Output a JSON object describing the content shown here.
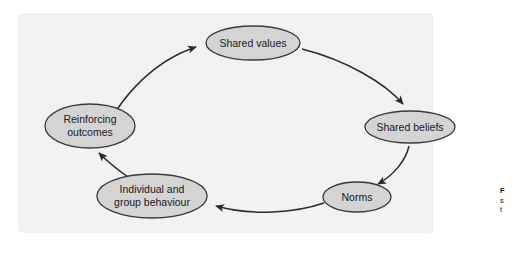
{
  "figure": {
    "background_color": "#f2f2f2",
    "page_background_color": "#ffffff",
    "node_fill_color": "#d4d4d4",
    "node_stroke_color": "#3a3a3a",
    "arrow_color": "#2b2b2b",
    "label_color": "#1a1a1a"
  },
  "diagram": {
    "type": "cycle",
    "direction": "clockwise",
    "nodes": [
      {
        "id": "shared-values",
        "label": "Shared values",
        "lines": [
          "Shared values"
        ],
        "cx": 253,
        "cy": 43,
        "rx": 47,
        "ry": 17
      },
      {
        "id": "shared-beliefs",
        "label": "Shared beliefs",
        "lines": [
          "Shared beliefs"
        ],
        "cx": 410,
        "cy": 127,
        "rx": 45,
        "ry": 16
      },
      {
        "id": "norms",
        "label": "Norms",
        "lines": [
          "Norms"
        ],
        "cx": 357,
        "cy": 197,
        "rx": 34,
        "ry": 15
      },
      {
        "id": "individual-and-group-behaviour",
        "label": "Individual and group behaviour",
        "lines": [
          "Individual and",
          "group behaviour"
        ],
        "cx": 152,
        "cy": 196,
        "rx": 55,
        "ry": 22
      },
      {
        "id": "reinforcing-outcomes",
        "label": "Reinforcing outcomes",
        "lines": [
          "Reinforcing",
          "outcomes"
        ],
        "cx": 90,
        "cy": 126,
        "rx": 45,
        "ry": 22
      }
    ],
    "edges": [
      {
        "id": "edge-reinforcing-to-values",
        "from": "reinforcing-outcomes",
        "to": "shared-values"
      },
      {
        "id": "edge-values-to-beliefs",
        "from": "shared-values",
        "to": "shared-beliefs"
      },
      {
        "id": "edge-beliefs-to-norms",
        "from": "shared-beliefs",
        "to": "norms"
      },
      {
        "id": "edge-norms-to-behaviour",
        "from": "norms",
        "to": "individual-and-group-behaviour"
      },
      {
        "id": "edge-behaviour-to-reinforcing",
        "from": "individual-and-group-behaviour",
        "to": "reinforcing-outcomes"
      }
    ]
  },
  "caption": {
    "clipped": true,
    "lines": [
      "F",
      "s",
      "t"
    ]
  }
}
